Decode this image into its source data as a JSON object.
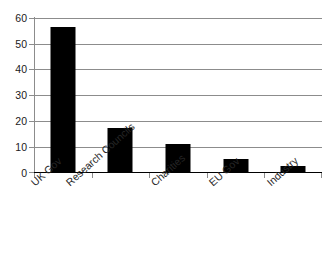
{
  "chart_data": {
    "type": "bar",
    "title": "",
    "subtitle": "",
    "xlabel": "",
    "ylabel": "",
    "categories": [
      "UK Gov",
      "Research Councils",
      "Charities",
      "EU Gov",
      "Industry"
    ],
    "values": [
      56.5,
      17,
      11,
      5,
      2.5
    ],
    "series": [
      {
        "name": "Funding share",
        "values": [
          56.5,
          17,
          11,
          5,
          2.5
        ]
      }
    ],
    "ylim": [
      0,
      60
    ],
    "yticks": [
      0,
      10,
      20,
      30,
      40,
      50,
      60
    ],
    "ytick_labels": [
      "0",
      "10",
      "20",
      "30",
      "40",
      "50",
      "60"
    ],
    "grid": true,
    "grid_axis": "y",
    "legend": false,
    "legend_position": "none",
    "bar_color": "#000000",
    "gridline_color": "#8c8c8c",
    "axis_color": "#8c8c8c",
    "background_color": "#ffffff",
    "xtick_label_rotation": -42
  }
}
